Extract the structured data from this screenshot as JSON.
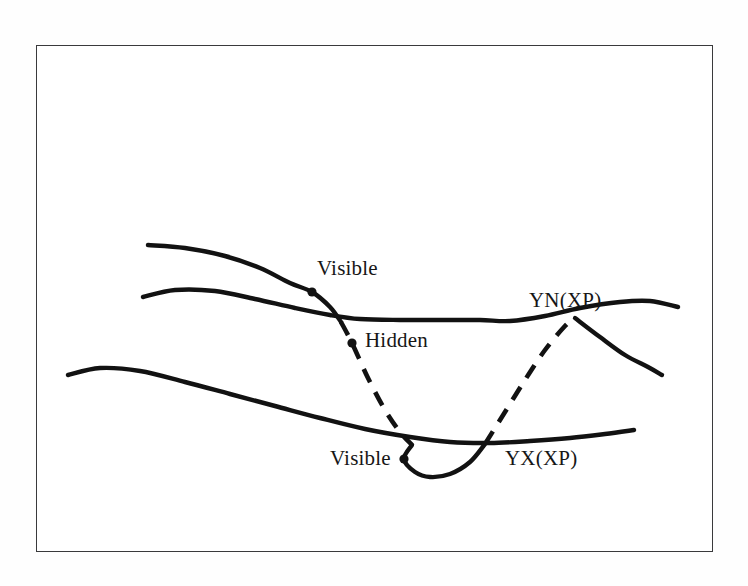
{
  "figure": {
    "kind": "line-diagram",
    "background_color": "#fefefe",
    "frame_color": "#3a3a3c",
    "stroke_color": "#121212"
  },
  "labels": {
    "visible_top": "Visible",
    "hidden": "Hidden",
    "visible_bottom": "Visible",
    "curve_yn": "YN(XP)",
    "curve_yx": "YX(XP)"
  },
  "chart_data": {
    "type": "line",
    "title": "",
    "xlabel": "",
    "ylabel": "",
    "grid": false,
    "legend": "inline-annotations",
    "axis_ticks": false,
    "annotations": [
      {
        "text": "Visible",
        "x": 318,
        "y": 270,
        "marker_x": 312,
        "marker_y": 292
      },
      {
        "text": "Hidden",
        "x": 366,
        "y": 342,
        "marker_x": 352,
        "marker_y": 343
      },
      {
        "text": "Visible",
        "x": 331,
        "y": 460,
        "marker_x": 404,
        "marker_y": 459
      },
      {
        "text": "YN(XP)",
        "x": 530,
        "y": 302,
        "marker_x": null,
        "marker_y": null
      },
      {
        "text": "YX(XP)",
        "x": 506,
        "y": 460,
        "marker_x": null,
        "marker_y": null
      }
    ],
    "series": [
      {
        "name": "YN(XP)",
        "style": "solid",
        "points": [
          [
            143,
            297
          ],
          [
            175,
            290
          ],
          [
            215,
            291
          ],
          [
            255,
            299
          ],
          [
            295,
            308
          ],
          [
            330,
            315
          ],
          [
            360,
            319
          ],
          [
            400,
            320
          ],
          [
            440,
            320
          ],
          [
            480,
            320
          ],
          [
            510,
            321
          ],
          [
            545,
            316
          ],
          [
            580,
            308
          ],
          [
            620,
            302
          ],
          [
            650,
            301
          ],
          [
            678,
            307
          ]
        ]
      },
      {
        "name": "descending-visible-upper",
        "style": "solid",
        "points": [
          [
            148,
            245
          ],
          [
            185,
            248
          ],
          [
            225,
            256
          ],
          [
            260,
            268
          ],
          [
            290,
            283
          ],
          [
            312,
            292
          ],
          [
            330,
            307
          ],
          [
            341,
            322
          ]
        ]
      },
      {
        "name": "descending-hidden",
        "style": "dashed",
        "points": [
          [
            341,
            322
          ],
          [
            352,
            343
          ],
          [
            368,
            378
          ],
          [
            385,
            410
          ],
          [
            400,
            432
          ],
          [
            412,
            445
          ]
        ]
      },
      {
        "name": "valley-visible-lower",
        "style": "solid",
        "points": [
          [
            412,
            445
          ],
          [
            404,
            459
          ],
          [
            415,
            472
          ],
          [
            430,
            477
          ],
          [
            450,
            474
          ],
          [
            470,
            462
          ],
          [
            485,
            444
          ]
        ]
      },
      {
        "name": "ascending-hidden",
        "style": "dashed",
        "points": [
          [
            485,
            444
          ],
          [
            505,
            412
          ],
          [
            525,
            380
          ],
          [
            545,
            350
          ],
          [
            565,
            326
          ],
          [
            575,
            318
          ]
        ]
      },
      {
        "name": "descending-right-tail",
        "style": "solid",
        "points": [
          [
            575,
            318
          ],
          [
            600,
            337
          ],
          [
            625,
            355
          ],
          [
            648,
            367
          ],
          [
            662,
            375
          ]
        ]
      },
      {
        "name": "YX(XP)",
        "style": "solid",
        "points": [
          [
            68,
            375
          ],
          [
            100,
            368
          ],
          [
            140,
            371
          ],
          [
            185,
            382
          ],
          [
            230,
            394
          ],
          [
            275,
            406
          ],
          [
            320,
            418
          ],
          [
            365,
            429
          ],
          [
            410,
            437
          ],
          [
            450,
            442
          ],
          [
            490,
            443
          ],
          [
            530,
            441
          ],
          [
            570,
            438
          ],
          [
            605,
            434
          ],
          [
            634,
            430
          ]
        ]
      }
    ]
  }
}
